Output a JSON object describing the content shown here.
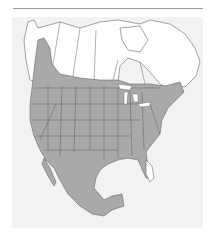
{
  "map": {
    "type": "range-map",
    "region": "North America",
    "style": "grayscale",
    "colors": {
      "background": "#ffffff",
      "panel": "#f2f2f2",
      "land_unshaded": "#ffffff",
      "range_fill": "#a9a9a9",
      "boundary_lines": "#555555",
      "top_rule": "#9a9a9a"
    },
    "range_extent": [
      "southern Canada",
      "western lobe through British Columbia to Yukon",
      "contiguous United States (excluding southern Florida)",
      "Mexico",
      "northern Central America"
    ]
  }
}
